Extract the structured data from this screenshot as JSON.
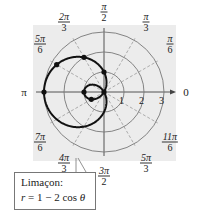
{
  "chart_data": {
    "type": "polar-line",
    "title": "",
    "equation": "r = 1 - 2 cos θ",
    "curve_name": "Limaçon",
    "radial_ticks": [
      1,
      2,
      3
    ],
    "rmax": 3,
    "angle_labels": [
      {
        "angle_deg": 0,
        "label": "0"
      },
      {
        "angle_deg": 30,
        "num": "π",
        "den": "6"
      },
      {
        "angle_deg": 60,
        "num": "π",
        "den": "3"
      },
      {
        "angle_deg": 90,
        "num": "π",
        "den": "2"
      },
      {
        "angle_deg": 120,
        "num": "2π",
        "den": "3"
      },
      {
        "angle_deg": 150,
        "num": "5π",
        "den": "6"
      },
      {
        "angle_deg": 180,
        "label": "π"
      },
      {
        "angle_deg": 210,
        "num": "7π",
        "den": "6"
      },
      {
        "angle_deg": 240,
        "num": "4π",
        "den": "3"
      },
      {
        "angle_deg": 270,
        "num": "3π",
        "den": "2"
      },
      {
        "angle_deg": 300,
        "num": "5π",
        "den": "3"
      },
      {
        "angle_deg": 330,
        "num": "11π",
        "den": "6"
      }
    ],
    "marked_points": [
      {
        "theta": "0",
        "r": -1
      },
      {
        "theta": "π/3",
        "r": 0
      },
      {
        "theta": "π/2",
        "r": 1
      },
      {
        "theta": "2π/3",
        "r": 2
      },
      {
        "theta": "5π/6",
        "r": 2.732
      },
      {
        "theta": "π",
        "r": 3
      },
      {
        "theta": "π/6",
        "r": -0.732
      }
    ],
    "grid": true,
    "gridlines_dashed_every_deg": 30,
    "axis_arrow": "polar axis arrow at 0"
  },
  "callout": {
    "line1": "Limaçon:",
    "line2_prefix": "r",
    "line2_rest": " = 1 − 2 cos ",
    "line2_theta": "θ"
  },
  "colors": {
    "background_panel": "#ececec",
    "curve": "#111111",
    "circles": "#777777",
    "dashed": "#9a9a9a"
  }
}
